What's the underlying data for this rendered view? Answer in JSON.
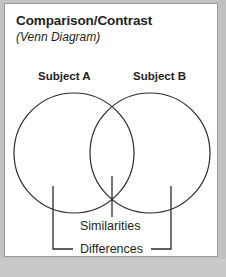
{
  "document": {
    "title": "Comparison/Contrast",
    "subtitle": "(Venn Diagram)"
  },
  "diagram": {
    "type": "venn",
    "set_labels": [
      {
        "id": "subject-a",
        "text": "Subject A"
      },
      {
        "id": "subject-b",
        "text": "Subject B"
      }
    ],
    "region_labels": [
      {
        "id": "similarities",
        "text": "Similarities",
        "region": "intersection"
      },
      {
        "id": "differences",
        "text": "Differences",
        "region": "exclusive-both"
      }
    ]
  },
  "colors": {
    "stroke": "#2b2b2b",
    "text": "#231f20",
    "paper": "#ffffff",
    "backdrop": "#c3c3c3"
  }
}
